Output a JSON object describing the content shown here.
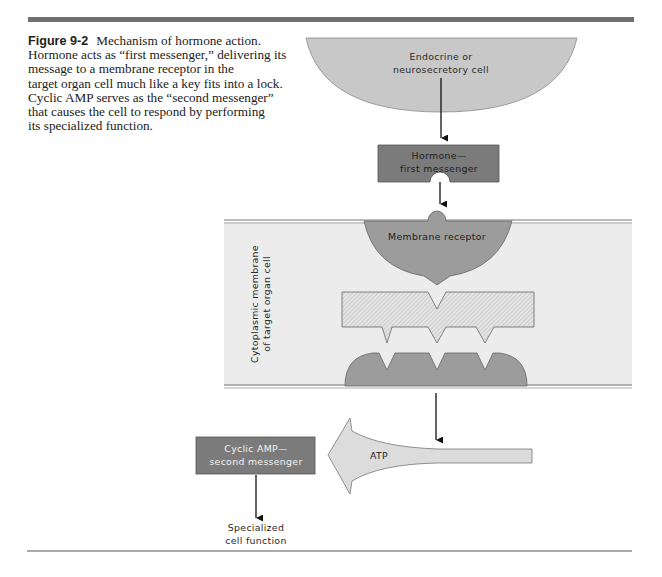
{
  "figure": {
    "number": "Figure 9-2",
    "caption_lines": [
      "Mechanism of hormone action.",
      "Hormone acts as “first messenger,” delivering its",
      "message to a membrane receptor in the",
      "target organ cell much like a key fits into a lock.",
      "Cyclic AMP serves as the “second messenger”",
      "that causes the cell to respond by performing",
      "its specialized function."
    ]
  },
  "diagram": {
    "source_cell": {
      "line1": "Endocrine or",
      "line2": "neurosecretory cell"
    },
    "hormone": {
      "line1": "Hormone—",
      "line2": "first messenger"
    },
    "receptor": {
      "label": "Membrane receptor"
    },
    "membrane": {
      "line1": "Cytoplasmic membrane",
      "line2": "of target organ cell"
    },
    "atp": {
      "label": "ATP"
    },
    "cyclic_amp": {
      "line1": "Cyclic AMP—",
      "line2": "second messenger"
    },
    "result": {
      "line1": "Specialized",
      "line2": "cell function"
    }
  },
  "colors": {
    "rule": "#6f6f6f",
    "cell_fill": "#c8c8c8",
    "box_fill": "#7b7b7b",
    "receptor_fill": "#9c9c9c",
    "membrane_fill": "#ececec",
    "atp_fill": "#dcdcdc"
  }
}
